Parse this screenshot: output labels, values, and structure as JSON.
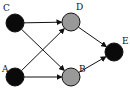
{
  "diagram": {
    "type": "directed-graph",
    "nodes": [
      {
        "id": "C",
        "label": "C",
        "x": 15,
        "y": 23,
        "fill": "#0a0a0a",
        "lx": 3,
        "ly": 11
      },
      {
        "id": "A",
        "label": "A",
        "x": 15,
        "y": 77,
        "fill": "#0a0a0a",
        "lx": 2,
        "ly": 72
      },
      {
        "id": "D",
        "label": "D",
        "x": 71,
        "y": 22,
        "fill": "#999999",
        "lx": 76,
        "ly": 10
      },
      {
        "id": "B",
        "label": "B",
        "x": 71,
        "y": 77,
        "fill": "#999999",
        "lx": 79,
        "ly": 72
      },
      {
        "id": "E",
        "label": "E",
        "x": 114,
        "y": 52,
        "fill": "#0a0a0a",
        "lx": 122,
        "ly": 44
      }
    ],
    "edges": [
      {
        "from": "C",
        "to": "D"
      },
      {
        "from": "C",
        "to": "B"
      },
      {
        "from": "A",
        "to": "D"
      },
      {
        "from": "A",
        "to": "B"
      },
      {
        "from": "D",
        "to": "E"
      },
      {
        "from": "B",
        "to": "E"
      }
    ],
    "node_radius": 9
  }
}
